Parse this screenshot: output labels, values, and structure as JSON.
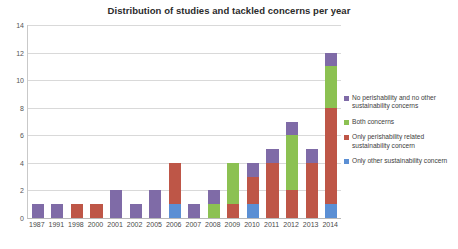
{
  "chart_data": {
    "type": "bar",
    "title": "Distribution of studies and tackled concerns per year",
    "xlabel": "",
    "ylabel": "",
    "ylim": [
      0,
      14
    ],
    "ytick_step": 2,
    "yticks": [
      "0",
      "2",
      "4",
      "6",
      "8",
      "10",
      "12",
      "14"
    ],
    "grid": true,
    "stacked": true,
    "legend_position": "right",
    "categories": [
      "1987",
      "1991",
      "1998",
      "2000",
      "2001",
      "2002",
      "2005",
      "2006",
      "2007",
      "2008",
      "2009",
      "2010",
      "2011",
      "2012",
      "2013",
      "2014"
    ],
    "series": [
      {
        "name": "Only other sustainability concern",
        "color": "#5B8FD4",
        "values": [
          0,
          0,
          0,
          0,
          0,
          0,
          0,
          1,
          0,
          0,
          0,
          1,
          0,
          0,
          0,
          1
        ]
      },
      {
        "name": "Only perishability related sustainability concern",
        "color": "#BE5647",
        "values": [
          0,
          0,
          1,
          1,
          0,
          0,
          0,
          3,
          0,
          0,
          1,
          2,
          4,
          2,
          4,
          7
        ]
      },
      {
        "name": "Both concerns",
        "color": "#8CC152",
        "values": [
          0,
          0,
          0,
          0,
          0,
          0,
          0,
          0,
          0,
          1,
          3,
          0,
          0,
          4,
          0,
          3
        ]
      },
      {
        "name": "No perishability and no other sustainability concerns",
        "color": "#7F6BA7",
        "values": [
          1,
          1,
          0,
          0,
          2,
          1,
          2,
          0,
          1,
          1,
          0,
          1,
          1,
          1,
          1,
          1
        ]
      }
    ],
    "totals": [
      1,
      1,
      1,
      1,
      2,
      1,
      2,
      4,
      1,
      2,
      4,
      4,
      5,
      7,
      5,
      12
    ]
  },
  "legend": {
    "items": [
      {
        "label": "No perishability and no other sustainability concerns",
        "color": "#7F6BA7"
      },
      {
        "label": "Both concerns",
        "color": "#8CC152"
      },
      {
        "label": "Only perishability related sustainability concern",
        "color": "#BE5647"
      },
      {
        "label": "Only other sustainability concern",
        "color": "#5B8FD4"
      }
    ]
  }
}
